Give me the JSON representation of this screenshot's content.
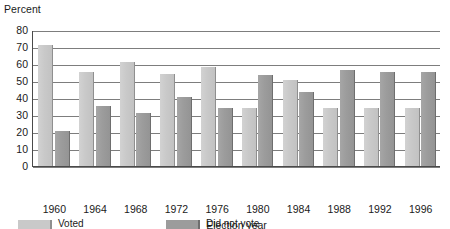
{
  "chart_data": {
    "type": "bar",
    "title": "",
    "xlabel": "Election year",
    "ylabel": "Percent",
    "categories": [
      "1960",
      "1964",
      "1968",
      "1972",
      "1976",
      "1980",
      "1984",
      "1988",
      "1992",
      "1996"
    ],
    "series": [
      {
        "name": "Voted",
        "color": "#c9c9c9",
        "values": [
          72,
          56,
          62,
          55,
          59,
          35,
          51,
          35,
          35,
          35
        ]
      },
      {
        "name": "Did not vote",
        "color": "#9c9c9c",
        "values": [
          21,
          36,
          32,
          41,
          35,
          54,
          44,
          57,
          56,
          56
        ]
      }
    ],
    "ylim": [
      0,
      80
    ],
    "ytick_values": [
      "80",
      "70",
      "60",
      "50",
      "40",
      "30",
      "20",
      "10",
      "0"
    ],
    "grid": true,
    "legend_position": "bottom"
  },
  "axes": {
    "y_title": "Percent",
    "x_title": "Election year"
  }
}
